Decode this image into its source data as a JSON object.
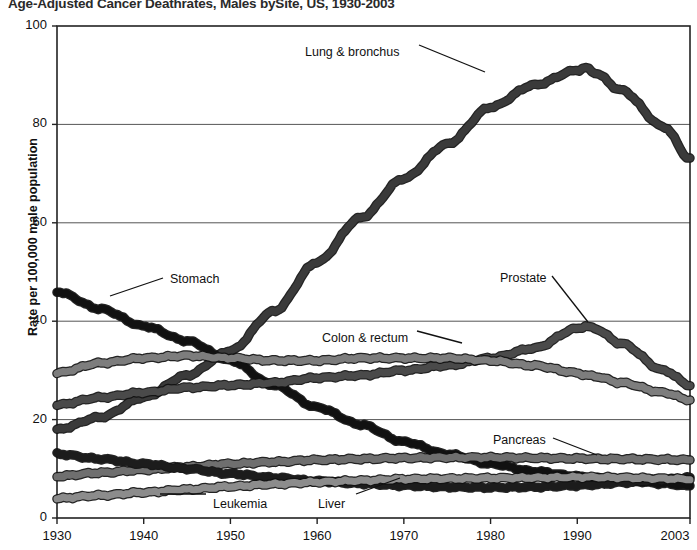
{
  "chart_data": {
    "type": "line",
    "title": "Age-Adjusted Cancer Deathrates, Males bySite, US, 1930-2003",
    "xlabel": "",
    "ylabel": "Rate per 100,000 male population",
    "xlim": [
      1930,
      2003
    ],
    "ylim": [
      0,
      100
    ],
    "yticks": [
      "0",
      "20",
      "40",
      "60",
      "80",
      "100"
    ],
    "ytick_values": [
      0,
      20,
      40,
      60,
      80,
      100
    ],
    "xticks": [
      "1930",
      "1940",
      "1950",
      "1960",
      "1970",
      "1980",
      "1990",
      "2003"
    ],
    "xtick_values": [
      1930,
      1940,
      1950,
      1960,
      1970,
      1980,
      1990,
      2003
    ],
    "grid": "horizontal",
    "legend": "inline-annotations",
    "x": [
      1930,
      1935,
      1940,
      1945,
      1950,
      1955,
      1960,
      1965,
      1970,
      1975,
      1980,
      1985,
      1990,
      1991,
      1992,
      1995,
      2000,
      2003
    ],
    "series": [
      {
        "name": "Lung & bronchus",
        "color": "#3a3a3a",
        "label_x": 305,
        "label_y": 45,
        "values": [
          18.0,
          20.5,
          24.5,
          29.0,
          34.0,
          42.0,
          52.0,
          61.0,
          69.0,
          76.0,
          83.5,
          88.0,
          91.0,
          91.5,
          90.5,
          87.0,
          79.5,
          73.0
        ]
      },
      {
        "name": "Stomach",
        "color": "#111111",
        "label_x": 170,
        "label_y": 272,
        "values": [
          46.0,
          42.5,
          39.0,
          36.0,
          32.0,
          27.0,
          22.5,
          19.0,
          15.5,
          13.0,
          11.0,
          9.5,
          8.5,
          8.3,
          8.1,
          7.7,
          7.0,
          6.5
        ]
      },
      {
        "name": "Prostate",
        "color": "#4a4a4a",
        "label_x": 500,
        "label_y": 271,
        "values": [
          23.0,
          24.5,
          25.5,
          26.5,
          27.0,
          27.5,
          28.5,
          29.0,
          30.0,
          31.0,
          32.5,
          34.5,
          38.5,
          39.0,
          38.5,
          35.5,
          30.0,
          27.0
        ]
      },
      {
        "name": "Colon & rectum",
        "color": "#7d7d7d",
        "label_x": 322,
        "label_y": 331,
        "values": [
          29.5,
          31.5,
          32.5,
          33.0,
          32.5,
          32.0,
          32.0,
          32.5,
          32.5,
          32.5,
          32.0,
          31.0,
          29.5,
          29.0,
          28.8,
          27.5,
          25.5,
          24.0
        ]
      },
      {
        "name": "Pancreas",
        "color": "#6f6f6f",
        "label_x": 493,
        "label_y": 433,
        "values": [
          8.5,
          9.2,
          9.8,
          10.4,
          11.0,
          11.4,
          11.8,
          12.0,
          12.2,
          12.3,
          12.3,
          12.2,
          12.1,
          12.1,
          12.0,
          12.0,
          11.9,
          11.8
        ]
      },
      {
        "name": "Liver",
        "color": "#1c1c1c",
        "label_x": 318,
        "label_y": 497,
        "values": [
          13.0,
          12.0,
          11.0,
          10.0,
          9.0,
          8.2,
          7.5,
          7.0,
          6.6,
          6.3,
          6.2,
          6.3,
          6.6,
          6.7,
          6.8,
          7.2,
          7.8,
          8.2
        ]
      },
      {
        "name": "Leukemia",
        "color": "#8c8c8c",
        "label_x": 213,
        "label_y": 497,
        "values": [
          4.0,
          4.6,
          5.2,
          5.8,
          6.4,
          6.9,
          7.3,
          7.6,
          7.9,
          8.0,
          8.1,
          8.2,
          8.3,
          8.3,
          8.3,
          8.2,
          8.0,
          7.9
        ]
      }
    ],
    "leaders": [
      {
        "for": "Lung & bronchus",
        "x1": 419,
        "y1": 45,
        "x2": 485,
        "y2": 72
      },
      {
        "for": "Stomach",
        "x1": 163,
        "y1": 278,
        "x2": 110,
        "y2": 296
      },
      {
        "for": "Prostate",
        "x1": 552,
        "y1": 276,
        "x2": 588,
        "y2": 322
      },
      {
        "for": "Colon & rectum",
        "x1": 417,
        "y1": 331,
        "x2": 462,
        "y2": 343
      },
      {
        "for": "Pancreas",
        "x1": 553,
        "y1": 438,
        "x2": 597,
        "y2": 455
      },
      {
        "for": "Liver",
        "x1": 356,
        "y1": 494,
        "x2": 400,
        "y2": 478
      },
      {
        "for": "Leukemia",
        "x1": 206,
        "y1": 494,
        "x2": 160,
        "y2": 494
      }
    ]
  },
  "axes": {
    "frame_color": "#222222",
    "grid_color": "#555555"
  }
}
